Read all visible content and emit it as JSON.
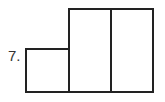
{
  "problem": {
    "number_label": "7.",
    "figure": {
      "description": "Composite shape: one small square on the left and two tall rectangles side by side",
      "stroke_color": "#222222",
      "shapes": [
        {
          "name": "small-square",
          "x": 26,
          "y": 49,
          "w": 43,
          "h": 43
        },
        {
          "name": "tall-rect-1",
          "x": 69,
          "y": 9,
          "w": 42,
          "h": 83
        },
        {
          "name": "tall-rect-2",
          "x": 111,
          "y": 9,
          "w": 42,
          "h": 83
        }
      ]
    }
  }
}
